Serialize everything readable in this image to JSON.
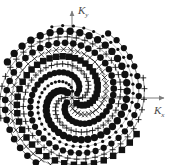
{
  "figure": {
    "background_color": "#ffffff",
    "width": 173,
    "height": 165
  },
  "axes": {
    "x_label": "K",
    "x_label_sub": "x",
    "y_label": "K",
    "y_label_sub": "y",
    "axis_color": "#7d7d7d",
    "origin_px": [
      72,
      98
    ],
    "x_axis_end_px": [
      164,
      98
    ],
    "y_axis_end_px": [
      72,
      11
    ],
    "arrowheads": true
  },
  "chart_data": {
    "type": "scatter",
    "title": "",
    "xlabel": "Kx",
    "ylabel": "Ky",
    "grid": false,
    "legend": false,
    "xlim": [
      -1.15,
      1.15
    ],
    "ylim": [
      -1.15,
      1.15
    ],
    "marker_color": "#111111",
    "spiral": {
      "n_arms": 8,
      "turns": 1.08,
      "points_per_arm": 46,
      "r_max": 1.0,
      "r_exponent": 0.62,
      "base_angle_deg": 122,
      "direction": "counterclockwise"
    },
    "arms": [
      {
        "index": 0,
        "phase_deg": 0,
        "marker": "circle-filled",
        "marker_size": 4.0,
        "stroke": 1.6
      },
      {
        "index": 1,
        "phase_deg": 45,
        "marker": "plus",
        "marker_size": 3.2,
        "stroke": 1.0
      },
      {
        "index": 2,
        "phase_deg": 90,
        "marker": "circle-filled",
        "marker_size": 3.6,
        "stroke": 1.4
      },
      {
        "index": 3,
        "phase_deg": 135,
        "marker": "x",
        "marker_size": 2.8,
        "stroke": 0.9
      },
      {
        "index": 4,
        "phase_deg": 180,
        "marker": "square-filled",
        "marker_size": 3.8,
        "stroke": 1.5
      },
      {
        "index": 5,
        "phase_deg": 225,
        "marker": "plus",
        "marker_size": 3.0,
        "stroke": 1.0
      },
      {
        "index": 6,
        "phase_deg": 270,
        "marker": "circle-filled",
        "marker_size": 3.4,
        "stroke": 1.3
      },
      {
        "index": 7,
        "phase_deg": 315,
        "marker": "dot",
        "marker_size": 1.6,
        "stroke": 0.6
      }
    ]
  }
}
